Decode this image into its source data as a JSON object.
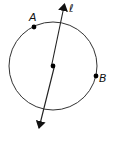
{
  "figure": {
    "colors": {
      "stroke": "#333333",
      "point": "#000000",
      "text": "#111111",
      "background": "#ffffff"
    },
    "circle": {
      "cx": 53,
      "cy": 66,
      "r": 44
    },
    "center_point": {
      "x": 53,
      "y": 66
    },
    "points": [
      {
        "label": "A",
        "x": 34,
        "y": 27
      },
      {
        "label": "B",
        "x": 96,
        "y": 76
      }
    ],
    "line": {
      "label": "ℓ",
      "x1": 64,
      "y1": 4,
      "x2": 39,
      "y2": 128,
      "arrows": "both"
    }
  },
  "labels": {
    "point_a": "A",
    "point_b": "B",
    "line_l": "ℓ"
  }
}
